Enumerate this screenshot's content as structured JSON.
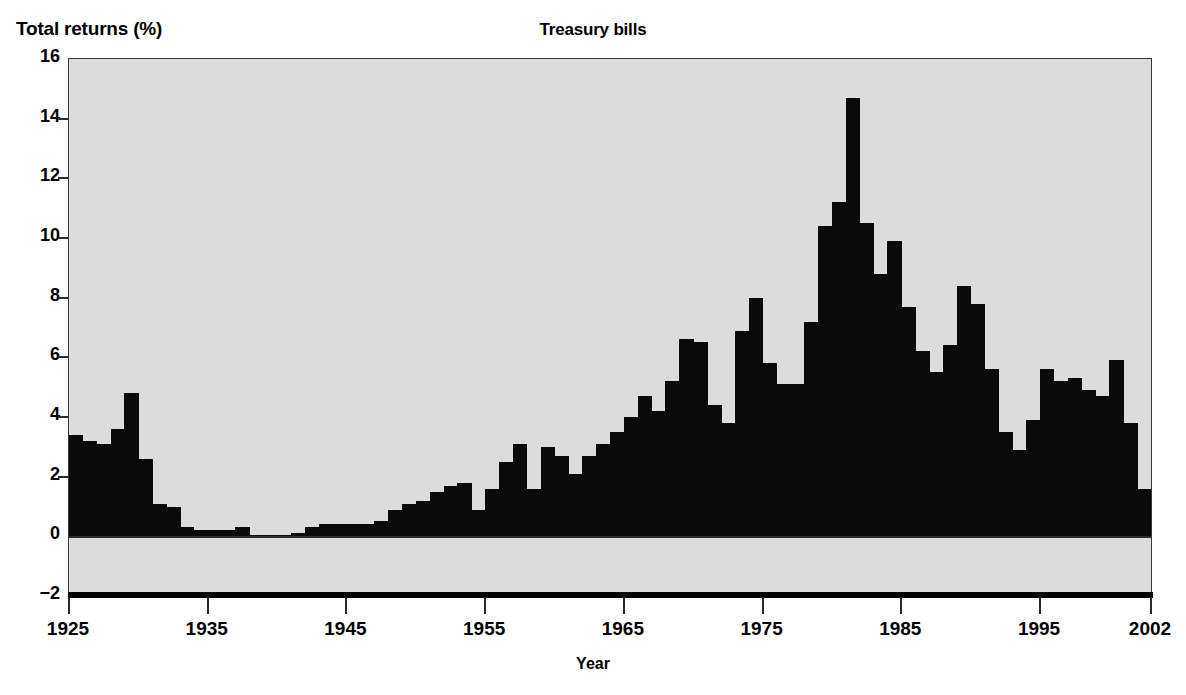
{
  "chart_data": {
    "type": "bar",
    "title": "Treasury bills",
    "xlabel": "Year",
    "ylabel": "Total returns (%)",
    "ylim": [
      -2,
      16
    ],
    "xlim": [
      1925,
      2002
    ],
    "grid": false,
    "legend": null,
    "y_ticks": [
      16,
      14,
      12,
      10,
      8,
      6,
      4,
      2,
      0,
      -2
    ],
    "y_tick_labels": [
      "16",
      "14",
      "12",
      "10",
      "8",
      "6",
      "4",
      "2",
      "0",
      "−2"
    ],
    "x_ticks": [
      1925,
      1935,
      1945,
      1955,
      1965,
      1975,
      1985,
      1995,
      2002
    ],
    "x_tick_labels": [
      "1925",
      "1935",
      "1945",
      "1955",
      "1965",
      "1975",
      "1985",
      "1995",
      "2002"
    ],
    "bar_color": "#0a0a0a",
    "plot_background": "#dcdcdc",
    "categories": [
      1925,
      1926,
      1927,
      1928,
      1929,
      1930,
      1931,
      1932,
      1933,
      1934,
      1935,
      1936,
      1937,
      1938,
      1939,
      1940,
      1941,
      1942,
      1943,
      1944,
      1945,
      1946,
      1947,
      1948,
      1949,
      1950,
      1951,
      1952,
      1953,
      1954,
      1955,
      1956,
      1957,
      1958,
      1959,
      1960,
      1961,
      1962,
      1963,
      1964,
      1965,
      1966,
      1967,
      1968,
      1969,
      1970,
      1971,
      1972,
      1973,
      1974,
      1975,
      1976,
      1977,
      1978,
      1979,
      1980,
      1981,
      1982,
      1983,
      1984,
      1985,
      1986,
      1987,
      1988,
      1989,
      1990,
      1991,
      1992,
      1993,
      1994,
      1995,
      1996,
      1997,
      1998,
      1999,
      2000,
      2001,
      2002
    ],
    "values": [
      3.4,
      3.2,
      3.1,
      3.6,
      4.8,
      2.6,
      1.1,
      1.0,
      0.3,
      0.2,
      0.2,
      0.2,
      0.3,
      0.0,
      0.0,
      0.0,
      0.1,
      0.3,
      0.4,
      0.4,
      0.4,
      0.4,
      0.5,
      0.9,
      1.1,
      1.2,
      1.5,
      1.7,
      1.8,
      0.9,
      1.6,
      2.5,
      3.1,
      1.6,
      3.0,
      2.7,
      2.1,
      2.7,
      3.1,
      3.5,
      4.0,
      4.7,
      4.2,
      5.2,
      6.6,
      6.5,
      4.4,
      3.8,
      6.9,
      8.0,
      5.8,
      5.1,
      5.1,
      7.2,
      10.4,
      11.2,
      14.7,
      10.5,
      8.8,
      9.9,
      7.7,
      6.2,
      5.5,
      6.4,
      8.4,
      7.8,
      5.6,
      3.5,
      2.9,
      3.9,
      5.6,
      5.2,
      5.3,
      4.9,
      4.7,
      5.9,
      3.8,
      1.6
    ]
  }
}
